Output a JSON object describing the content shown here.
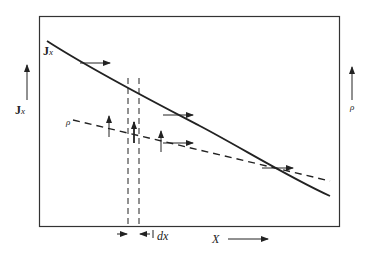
{
  "diagram": {
    "type": "flux-density-plot",
    "left_axis": {
      "symbol": "J",
      "subscript": "x"
    },
    "right_axis": {
      "symbol": "ρ"
    },
    "bottom_axis": {
      "symbol": "X"
    },
    "curve_labels": {
      "solid": {
        "symbol": "J",
        "subscript": "x"
      },
      "dashed": {
        "symbol": "ρ"
      }
    },
    "element_width_label": "dx",
    "colors": {
      "line": "#222222",
      "background": "#ffffff"
    }
  }
}
